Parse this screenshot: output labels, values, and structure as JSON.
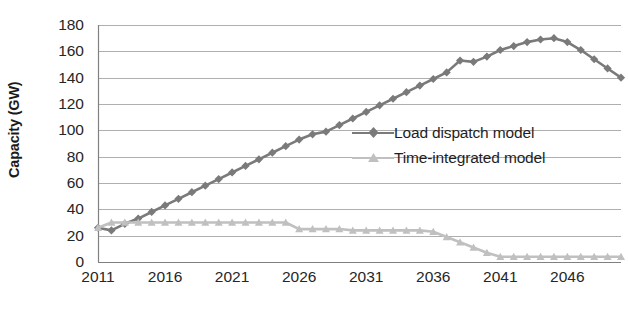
{
  "chart_data": {
    "type": "line",
    "title": "",
    "xlabel": "",
    "ylabel": "Capacity (GW)",
    "xlim": [
      2011,
      2050
    ],
    "ylim": [
      0,
      180
    ],
    "ytick_step": 20,
    "grid": true,
    "grid_axis": "y",
    "legend_position": "center-right-inside",
    "yticks": [
      "0",
      "20",
      "40",
      "60",
      "80",
      "100",
      "120",
      "140",
      "160",
      "180"
    ],
    "xticks": [
      "2011",
      "2016",
      "2021",
      "2026",
      "2031",
      "2036",
      "2041",
      "2046"
    ],
    "x": [
      2011,
      2012,
      2013,
      2014,
      2015,
      2016,
      2017,
      2018,
      2019,
      2020,
      2021,
      2022,
      2023,
      2024,
      2025,
      2026,
      2027,
      2028,
      2029,
      2030,
      2031,
      2032,
      2033,
      2034,
      2035,
      2036,
      2037,
      2038,
      2039,
      2040,
      2041,
      2042,
      2043,
      2044,
      2045,
      2046,
      2047,
      2048,
      2049,
      2050
    ],
    "series": [
      {
        "name": "Load dispatch model",
        "color": "#7a7a7a",
        "marker": "diamond",
        "values": [
          26,
          24,
          29,
          33,
          38,
          43,
          48,
          53,
          58,
          63,
          68,
          73,
          78,
          83,
          88,
          93,
          97,
          99,
          104,
          109,
          114,
          119,
          124,
          129,
          134,
          139,
          144,
          153,
          152,
          156,
          161,
          164,
          167,
          169,
          170,
          167,
          161,
          154,
          147,
          140
        ]
      },
      {
        "name": "Time-integrated model",
        "color": "#c0c0c0",
        "marker": "triangle",
        "values": [
          26,
          30,
          30,
          30,
          30,
          30,
          30,
          30,
          30,
          30,
          30,
          30,
          30,
          30,
          30,
          25,
          25,
          25,
          25,
          24,
          24,
          24,
          24,
          24,
          24,
          23,
          19,
          15,
          11,
          7,
          4,
          4,
          4,
          4,
          4,
          4,
          4,
          4,
          4,
          4
        ]
      }
    ]
  },
  "axes": {
    "y_title": "Capacity (GW)"
  },
  "legend": {
    "entries": [
      {
        "label": "Load dispatch model"
      },
      {
        "label": "Time-integrated model"
      }
    ]
  },
  "colors": {
    "series_dark": "#7a7a7a",
    "series_light": "#c0c0c0",
    "grid": "#a6a6a6",
    "axis": "#808080",
    "text": "#262626"
  }
}
